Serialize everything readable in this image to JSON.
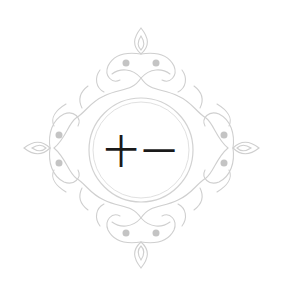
{
  "ornament": {
    "center_text": "十一",
    "colors": {
      "ornament": "#c9c9c9",
      "ornament_dark": "#b3b3b3",
      "ring": "#d4d4d4",
      "text": "#1a1a1a",
      "background": "#ffffff"
    }
  }
}
